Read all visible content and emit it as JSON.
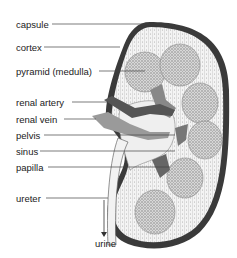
{
  "diagram": {
    "labels": [
      {
        "id": "capsule",
        "text": "capsule",
        "x": 16,
        "y": 19,
        "line_y": 24,
        "line_x2": 150
      },
      {
        "id": "cortex",
        "text": "cortex",
        "x": 16,
        "y": 42,
        "line_y": 47,
        "line_x2": 120
      },
      {
        "id": "pyramid",
        "text": "pyramid (medulla)",
        "x": 16,
        "y": 66,
        "line_y": 71,
        "line_x2": 145
      },
      {
        "id": "renal-artery",
        "text": "renal artery",
        "x": 16,
        "y": 97,
        "line_y": 102,
        "line_x2": 108
      },
      {
        "id": "renal-vein",
        "text": "renal vein",
        "x": 16,
        "y": 114,
        "line_y": 119,
        "line_x2": 96
      },
      {
        "id": "pelvis",
        "text": "pelvis",
        "x": 16,
        "y": 130,
        "line_y": 135,
        "line_x2": 175
      },
      {
        "id": "sinus",
        "text": "sinus",
        "x": 16,
        "y": 146,
        "line_y": 151,
        "line_x2": 175
      },
      {
        "id": "papilla",
        "text": "papilla",
        "x": 16,
        "y": 162,
        "line_y": 167,
        "line_x2": 170
      },
      {
        "id": "ureter",
        "text": "ureter",
        "x": 16,
        "y": 193,
        "line_y": 198,
        "line_x2": 108
      },
      {
        "id": "urine",
        "text": "urine",
        "x": 95,
        "y": 238
      }
    ],
    "colors": {
      "capsule": "#3a3a3a",
      "vessel_dark": "#555555",
      "vessel_light": "#999999",
      "pyramid": "#bdbdbd",
      "line": "#444444"
    }
  }
}
